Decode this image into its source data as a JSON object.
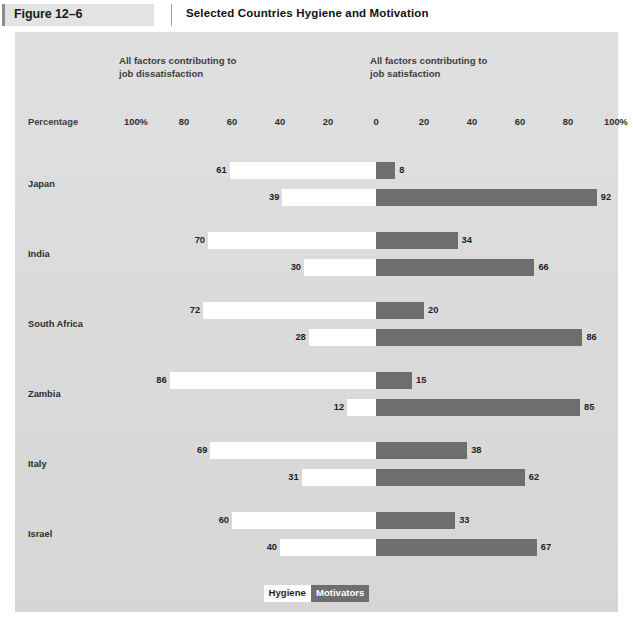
{
  "figure": {
    "tag": "Figure 12–6",
    "title": "Selected Countries Hygiene and Motivation"
  },
  "captions": {
    "left": "All factors contributing to\njob dissatisfaction",
    "right": "All factors contributing to\njob satisfaction"
  },
  "axis": {
    "name": "Percentage",
    "ticks": [
      "100%",
      "80",
      "60",
      "40",
      "20",
      "0",
      "20",
      "40",
      "60",
      "80",
      "100%"
    ]
  },
  "legend": {
    "hygiene": "Hygiene",
    "motivators": "Motivators"
  },
  "colors": {
    "hygiene": "#ffffff",
    "motivators": "#6e6e6e",
    "panel_background": "#dcdcdc",
    "text": "#2c2c2c"
  },
  "chart_data": {
    "type": "bar",
    "title": "Selected Countries Hygiene and Motivation",
    "orientation": "horizontal-diverging",
    "xlabel": "Percentage",
    "ylabel": "",
    "xlim": [
      -100,
      100
    ],
    "grid": false,
    "legend_position": "bottom",
    "left_axis_label": "All factors contributing to job dissatisfaction",
    "right_axis_label": "All factors contributing to job satisfaction",
    "series": [
      {
        "name": "Hygiene",
        "side": "left"
      },
      {
        "name": "Motivators",
        "side": "right"
      }
    ],
    "categories": [
      "Japan",
      "India",
      "South Africa",
      "Zambia",
      "Italy",
      "Israel"
    ],
    "rows": [
      {
        "country": "Japan",
        "bars": [
          {
            "series": "Hygiene",
            "left": 61,
            "right": 8
          },
          {
            "series": "Motivators",
            "left": 39,
            "right": 92
          }
        ]
      },
      {
        "country": "India",
        "bars": [
          {
            "series": "Hygiene",
            "left": 70,
            "right": 34
          },
          {
            "series": "Motivators",
            "left": 30,
            "right": 66
          }
        ]
      },
      {
        "country": "South Africa",
        "bars": [
          {
            "series": "Hygiene",
            "left": 72,
            "right": 20
          },
          {
            "series": "Motivators",
            "left": 28,
            "right": 86
          }
        ]
      },
      {
        "country": "Zambia",
        "bars": [
          {
            "series": "Hygiene",
            "left": 86,
            "right": 15
          },
          {
            "series": "Motivators",
            "left": 12,
            "right": 85
          }
        ]
      },
      {
        "country": "Italy",
        "bars": [
          {
            "series": "Hygiene",
            "left": 69,
            "right": 38
          },
          {
            "series": "Motivators",
            "left": 31,
            "right": 62
          }
        ]
      },
      {
        "country": "Israel",
        "bars": [
          {
            "series": "Hygiene",
            "left": 60,
            "right": 33
          },
          {
            "series": "Motivators",
            "left": 40,
            "right": 67
          }
        ]
      }
    ]
  },
  "layout": {
    "zero_x": 361,
    "px_per_unit": 2.4,
    "group_top": 130,
    "group_step": 70,
    "row_offsets": [
      0,
      27
    ]
  }
}
